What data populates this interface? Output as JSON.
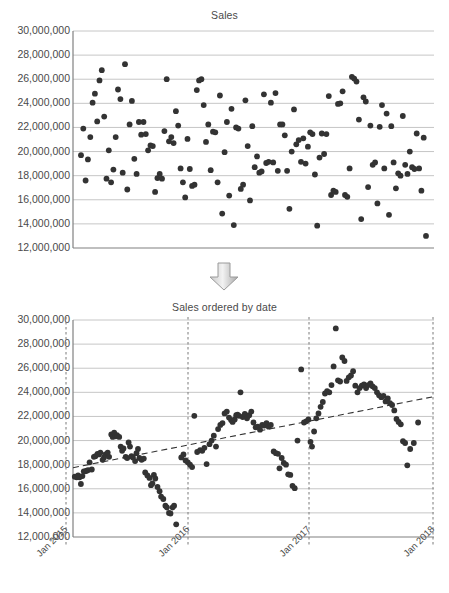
{
  "charts": [
    {
      "id": "sales-unordered",
      "title": "Sales",
      "type": "scatter",
      "ylabel": "",
      "xlabel": "",
      "ylim": [
        12000000,
        30000000
      ],
      "yticks": [
        "30,000,000",
        "28,000,000",
        "26,000,000",
        "24,000,000",
        "22,000,000",
        "20,000,000",
        "18,000,000",
        "16,000,000",
        "14,000,000",
        "12,000,000"
      ],
      "ytick_values": [
        30000000,
        28000000,
        26000000,
        24000000,
        22000000,
        20000000,
        18000000,
        16000000,
        14000000,
        12000000
      ],
      "xticks": [],
      "grid": true,
      "marker_color": "#333333",
      "points": [
        [
          1,
          19700000
        ],
        [
          2,
          21900000
        ],
        [
          3,
          17600000
        ],
        [
          4,
          19350000
        ],
        [
          5,
          21200000
        ],
        [
          6,
          24050000
        ],
        [
          7,
          24800000
        ],
        [
          8,
          22500000
        ],
        [
          9,
          25900000
        ],
        [
          10,
          26750000
        ],
        [
          11,
          22900000
        ],
        [
          12,
          17750000
        ],
        [
          13,
          20100000
        ],
        [
          14,
          17450000
        ],
        [
          15,
          18500000
        ],
        [
          16,
          21200000
        ],
        [
          17,
          25150000
        ],
        [
          18,
          24350000
        ],
        [
          19,
          18250000
        ],
        [
          20,
          27250000
        ],
        [
          21,
          16850000
        ],
        [
          22,
          22250000
        ],
        [
          23,
          24200000
        ],
        [
          24,
          19400000
        ],
        [
          25,
          18150000
        ],
        [
          26,
          22450000
        ],
        [
          27,
          21400000
        ],
        [
          28,
          22450000
        ],
        [
          29,
          21450000
        ],
        [
          30,
          20100000
        ],
        [
          31,
          20500000
        ],
        [
          32,
          20450000
        ],
        [
          33,
          16650000
        ],
        [
          34,
          17800000
        ],
        [
          35,
          18150000
        ],
        [
          36,
          17750000
        ],
        [
          37,
          21700000
        ],
        [
          38,
          26000000
        ],
        [
          39,
          20850000
        ],
        [
          40,
          21200000
        ],
        [
          41,
          20700000
        ],
        [
          42,
          23350000
        ],
        [
          43,
          22150000
        ],
        [
          44,
          18600000
        ],
        [
          45,
          17450000
        ],
        [
          46,
          16200000
        ],
        [
          47,
          21050000
        ],
        [
          48,
          18550000
        ],
        [
          49,
          17150000
        ],
        [
          50,
          17250000
        ],
        [
          51,
          25100000
        ],
        [
          52,
          25900000
        ],
        [
          53,
          26000000
        ],
        [
          54,
          23850000
        ],
        [
          55,
          20800000
        ],
        [
          56,
          22250000
        ],
        [
          57,
          18450000
        ],
        [
          58,
          21650000
        ],
        [
          59,
          21600000
        ],
        [
          60,
          17450000
        ],
        [
          61,
          24650000
        ],
        [
          62,
          14850000
        ],
        [
          63,
          19950000
        ],
        [
          64,
          22450000
        ],
        [
          65,
          16350000
        ],
        [
          66,
          23550000
        ],
        [
          67,
          13900000
        ],
        [
          68,
          22000000
        ],
        [
          69,
          21900000
        ],
        [
          70,
          16900000
        ],
        [
          71,
          17250000
        ],
        [
          72,
          24250000
        ],
        [
          73,
          20450000
        ],
        [
          74,
          15950000
        ],
        [
          75,
          22100000
        ],
        [
          76,
          18700000
        ],
        [
          77,
          19600000
        ],
        [
          78,
          18250000
        ],
        [
          79,
          18350000
        ],
        [
          80,
          24750000
        ],
        [
          81,
          19050000
        ],
        [
          82,
          19150000
        ],
        [
          83,
          24050000
        ],
        [
          84,
          19100000
        ],
        [
          85,
          24850000
        ],
        [
          86,
          18400000
        ],
        [
          87,
          22250000
        ],
        [
          88,
          22250000
        ],
        [
          89,
          21350000
        ],
        [
          90,
          18400000
        ],
        [
          91,
          15250000
        ],
        [
          92,
          20000000
        ],
        [
          93,
          23500000
        ],
        [
          94,
          20600000
        ],
        [
          95,
          20950000
        ],
        [
          96,
          19150000
        ],
        [
          97,
          21100000
        ],
        [
          98,
          19000000
        ],
        [
          99,
          20400000
        ],
        [
          100,
          21600000
        ],
        [
          101,
          21450000
        ],
        [
          102,
          18100000
        ],
        [
          103,
          13850000
        ],
        [
          104,
          19500000
        ],
        [
          105,
          21500000
        ],
        [
          106,
          19800000
        ],
        [
          107,
          21450000
        ],
        [
          108,
          24600000
        ],
        [
          109,
          16400000
        ],
        [
          110,
          16750000
        ],
        [
          111,
          16650000
        ],
        [
          112,
          23950000
        ],
        [
          113,
          24000000
        ],
        [
          114,
          25000000
        ],
        [
          115,
          16400000
        ],
        [
          116,
          16250000
        ],
        [
          117,
          18600000
        ],
        [
          118,
          26200000
        ],
        [
          119,
          26050000
        ],
        [
          120,
          25800000
        ],
        [
          121,
          22650000
        ],
        [
          122,
          14400000
        ],
        [
          123,
          24500000
        ],
        [
          124,
          24150000
        ],
        [
          125,
          17050000
        ],
        [
          126,
          22150000
        ],
        [
          127,
          18900000
        ],
        [
          128,
          19100000
        ],
        [
          129,
          15700000
        ],
        [
          130,
          22050000
        ],
        [
          131,
          23850000
        ],
        [
          132,
          18600000
        ],
        [
          133,
          23150000
        ],
        [
          134,
          14750000
        ],
        [
          135,
          22100000
        ],
        [
          136,
          19100000
        ],
        [
          137,
          16950000
        ],
        [
          138,
          18200000
        ],
        [
          139,
          18000000
        ],
        [
          140,
          22950000
        ],
        [
          141,
          18900000
        ],
        [
          142,
          18150000
        ],
        [
          143,
          20000000
        ],
        [
          144,
          18700000
        ],
        [
          145,
          18550000
        ],
        [
          146,
          21500000
        ],
        [
          147,
          18600000
        ],
        [
          148,
          16750000
        ],
        [
          149,
          21150000
        ],
        [
          150,
          13000000
        ]
      ]
    },
    {
      "id": "sales-ordered-by-date",
      "title": "Sales ordered by date",
      "type": "scatter",
      "ylabel": "",
      "xlabel": "",
      "ylim": [
        12000000,
        30000000
      ],
      "yticks": [
        "30,000,000",
        "28,000,000",
        "26,000,000",
        "24,000,000",
        "22,000,000",
        "20,000,000",
        "18,000,000",
        "16,000,000",
        "14,000,000",
        "12,000,000"
      ],
      "ytick_values": [
        30000000,
        28000000,
        26000000,
        24000000,
        22000000,
        20000000,
        18000000,
        16000000,
        14000000,
        12000000
      ],
      "xticks": [
        "Jan 2015",
        "Jan 2016",
        "Jan 2017",
        "Jan 2018"
      ],
      "xtick_positions": [
        0.0,
        0.3333,
        0.6667,
        1.0
      ],
      "grid": true,
      "marker_color": "#333333",
      "vertical_marker_lines": [
        "Jan 2015",
        "Jan 2016",
        "Jan 2017",
        "Jan 2018"
      ],
      "trendline": {
        "style": "dashed",
        "color": "#333333",
        "x0": 0.0,
        "y0": 17750000,
        "x1": 1.0,
        "y1": 23650000
      },
      "points": [
        [
          0.005,
          17000000
        ],
        [
          0.01,
          16950000
        ],
        [
          0.014,
          17100000
        ],
        [
          0.018,
          16950000
        ],
        [
          0.022,
          16400000
        ],
        [
          0.026,
          17050000
        ],
        [
          0.03,
          17450000
        ],
        [
          0.034,
          17450000
        ],
        [
          0.038,
          17500000
        ],
        [
          0.042,
          17550000
        ],
        [
          0.046,
          18200000
        ],
        [
          0.052,
          17600000
        ],
        [
          0.058,
          18650000
        ],
        [
          0.062,
          18700000
        ],
        [
          0.068,
          18900000
        ],
        [
          0.072,
          18850000
        ],
        [
          0.076,
          19000000
        ],
        [
          0.082,
          18400000
        ],
        [
          0.086,
          18600000
        ],
        [
          0.09,
          18850000
        ],
        [
          0.096,
          19000000
        ],
        [
          0.1,
          18650000
        ],
        [
          0.106,
          20500000
        ],
        [
          0.11,
          20300000
        ],
        [
          0.114,
          20650000
        ],
        [
          0.118,
          20350000
        ],
        [
          0.122,
          20450000
        ],
        [
          0.128,
          20300000
        ],
        [
          0.132,
          19500000
        ],
        [
          0.136,
          19150000
        ],
        [
          0.14,
          19350000
        ],
        [
          0.146,
          18650000
        ],
        [
          0.15,
          18550000
        ],
        [
          0.154,
          19850000
        ],
        [
          0.158,
          19500000
        ],
        [
          0.162,
          18700000
        ],
        [
          0.166,
          18600000
        ],
        [
          0.172,
          18300000
        ],
        [
          0.176,
          18950000
        ],
        [
          0.18,
          19300000
        ],
        [
          0.184,
          18550000
        ],
        [
          0.19,
          18400000
        ],
        [
          0.196,
          18500000
        ],
        [
          0.2,
          17350000
        ],
        [
          0.206,
          17100000
        ],
        [
          0.212,
          16900000
        ],
        [
          0.216,
          16300000
        ],
        [
          0.22,
          16450000
        ],
        [
          0.224,
          17150000
        ],
        [
          0.228,
          16850000
        ],
        [
          0.234,
          16150000
        ],
        [
          0.24,
          15800000
        ],
        [
          0.244,
          15350000
        ],
        [
          0.25,
          15150000
        ],
        [
          0.256,
          14600000
        ],
        [
          0.26,
          14450000
        ],
        [
          0.266,
          14000000
        ],
        [
          0.27,
          13950000
        ],
        [
          0.276,
          14450000
        ],
        [
          0.28,
          14600000
        ],
        [
          0.286,
          13050000
        ],
        [
          0.3,
          18600000
        ],
        [
          0.306,
          18850000
        ],
        [
          0.312,
          18350000
        ],
        [
          0.318,
          18200000
        ],
        [
          0.324,
          18000000
        ],
        [
          0.33,
          17800000
        ],
        [
          0.336,
          22050000
        ],
        [
          0.344,
          19050000
        ],
        [
          0.352,
          19200000
        ],
        [
          0.358,
          19150000
        ],
        [
          0.364,
          19400000
        ],
        [
          0.37,
          18050000
        ],
        [
          0.378,
          19700000
        ],
        [
          0.384,
          20000000
        ],
        [
          0.39,
          20400000
        ],
        [
          0.396,
          19500000
        ],
        [
          0.402,
          20950000
        ],
        [
          0.408,
          21300000
        ],
        [
          0.414,
          21450000
        ],
        [
          0.42,
          22250000
        ],
        [
          0.426,
          22400000
        ],
        [
          0.432,
          21900000
        ],
        [
          0.438,
          21700000
        ],
        [
          0.442,
          21550000
        ],
        [
          0.448,
          21750000
        ],
        [
          0.452,
          22100000
        ],
        [
          0.456,
          22150000
        ],
        [
          0.46,
          22050000
        ],
        [
          0.464,
          24000000
        ],
        [
          0.47,
          21950000
        ],
        [
          0.476,
          22200000
        ],
        [
          0.482,
          21850000
        ],
        [
          0.488,
          22100000
        ],
        [
          0.494,
          22400000
        ],
        [
          0.5,
          21500000
        ],
        [
          0.506,
          21100000
        ],
        [
          0.512,
          21150000
        ],
        [
          0.518,
          20900000
        ],
        [
          0.524,
          21300000
        ],
        [
          0.53,
          21250000
        ],
        [
          0.536,
          21450000
        ],
        [
          0.542,
          21150000
        ],
        [
          0.548,
          21300000
        ],
        [
          0.556,
          19100000
        ],
        [
          0.562,
          18950000
        ],
        [
          0.568,
          18900000
        ],
        [
          0.572,
          17700000
        ],
        [
          0.578,
          18550000
        ],
        [
          0.584,
          18150000
        ],
        [
          0.59,
          18000000
        ],
        [
          0.596,
          17200000
        ],
        [
          0.602,
          17150000
        ],
        [
          0.608,
          16250000
        ],
        [
          0.614,
          16050000
        ],
        [
          0.622,
          20000000
        ],
        [
          0.632,
          25900000
        ],
        [
          0.64,
          21500000
        ],
        [
          0.646,
          21600000
        ],
        [
          0.652,
          21750000
        ],
        [
          0.658,
          19900000
        ],
        [
          0.662,
          19500000
        ],
        [
          0.668,
          20750000
        ],
        [
          0.674,
          21850000
        ],
        [
          0.68,
          22250000
        ],
        [
          0.686,
          22800000
        ],
        [
          0.692,
          23200000
        ],
        [
          0.698,
          23900000
        ],
        [
          0.704,
          24100000
        ],
        [
          0.71,
          24000000
        ],
        [
          0.716,
          24600000
        ],
        [
          0.722,
          26150000
        ],
        [
          0.728,
          29300000
        ],
        [
          0.734,
          25000000
        ],
        [
          0.74,
          24900000
        ],
        [
          0.746,
          26900000
        ],
        [
          0.752,
          26600000
        ],
        [
          0.758,
          24950000
        ],
        [
          0.764,
          25250000
        ],
        [
          0.77,
          25400000
        ],
        [
          0.776,
          25750000
        ],
        [
          0.782,
          24550000
        ],
        [
          0.788,
          24000000
        ],
        [
          0.794,
          24350000
        ],
        [
          0.8,
          24550000
        ],
        [
          0.806,
          24650000
        ],
        [
          0.812,
          24350000
        ],
        [
          0.818,
          24600000
        ],
        [
          0.824,
          24750000
        ],
        [
          0.83,
          24500000
        ],
        [
          0.836,
          24350000
        ],
        [
          0.842,
          24000000
        ],
        [
          0.848,
          23750000
        ],
        [
          0.854,
          23600000
        ],
        [
          0.86,
          23700000
        ],
        [
          0.866,
          23250000
        ],
        [
          0.872,
          23500000
        ],
        [
          0.878,
          23100000
        ],
        [
          0.884,
          22950000
        ],
        [
          0.89,
          22500000
        ],
        [
          0.896,
          21800000
        ],
        [
          0.902,
          21550000
        ],
        [
          0.908,
          21350000
        ],
        [
          0.914,
          19950000
        ],
        [
          0.92,
          19800000
        ],
        [
          0.926,
          17950000
        ],
        [
          0.934,
          19300000
        ],
        [
          0.944,
          19800000
        ],
        [
          0.956,
          21500000
        ]
      ]
    }
  ]
}
